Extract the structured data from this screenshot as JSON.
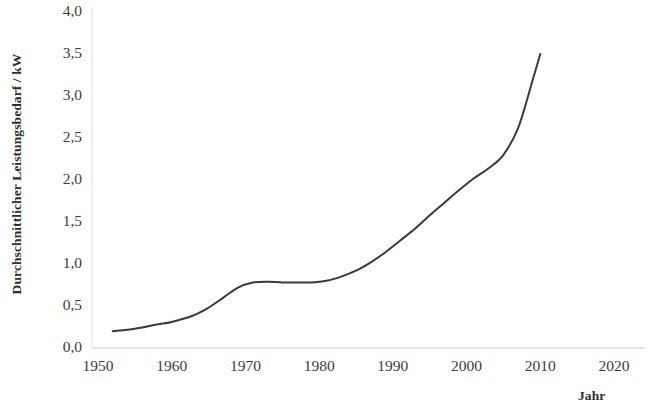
{
  "chart_data": {
    "type": "line",
    "title": "",
    "xlabel": "Jahr",
    "ylabel": "Durchschnittlicher Leistungsbedarf / kW",
    "xlim": [
      1950,
      2020
    ],
    "ylim": [
      0.0,
      4.0
    ],
    "grid": false,
    "legend": null,
    "legend_position": "none",
    "x_tick_labels": [
      "1950",
      "1960",
      "1970",
      "1980",
      "1990",
      "2000",
      "2010",
      "2020"
    ],
    "x_ticks": [
      1950,
      1960,
      1970,
      1980,
      1990,
      2000,
      2010,
      2020
    ],
    "y_tick_labels": [
      "0,0",
      "0,5",
      "1,0",
      "1,5",
      "2,0",
      "2,5",
      "3,0",
      "3,5",
      "4,0"
    ],
    "y_ticks": [
      0.0,
      0.5,
      1.0,
      1.5,
      2.0,
      2.5,
      3.0,
      3.5,
      4.0
    ],
    "series": [
      {
        "name": "Durchschnittlicher Leistungsbedarf",
        "color": "#3a3a3a",
        "line_width": 2,
        "x": [
          1952,
          1955,
          1958,
          1960,
          1963,
          1965,
          1967,
          1969,
          1971,
          1973,
          1975,
          1977,
          1979,
          1981,
          1983,
          1985,
          1987,
          1989,
          1991,
          1993,
          1995,
          1997,
          1999,
          2001,
          2003,
          2005,
          2007,
          2009,
          2010
        ],
        "y": [
          0.2,
          0.23,
          0.28,
          0.31,
          0.39,
          0.48,
          0.6,
          0.72,
          0.78,
          0.79,
          0.78,
          0.78,
          0.78,
          0.8,
          0.85,
          0.92,
          1.02,
          1.14,
          1.28,
          1.42,
          1.58,
          1.73,
          1.88,
          2.02,
          2.14,
          2.3,
          2.62,
          3.2,
          3.5
        ]
      }
    ],
    "axis_color": "#c9c9c9"
  },
  "axes": {
    "y_title": "Durchschnittlicher Leistungsbedarf / kW",
    "x_title": "Jahr"
  }
}
